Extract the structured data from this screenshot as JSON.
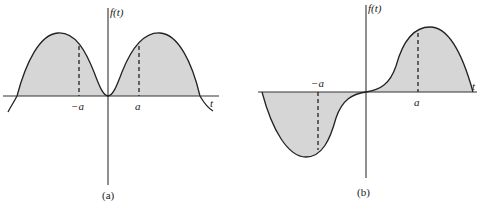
{
  "figure": {
    "panels": [
      {
        "id": "a",
        "caption": "(a)",
        "y_axis_label": "f(t)",
        "x_axis_label": "t",
        "tick_labels": [
          "−a",
          "a"
        ],
        "description": "Even function: two symmetric humps, shaded area above t-axis, touching zero at origin"
      },
      {
        "id": "b",
        "caption": "(b)",
        "y_axis_label": "f(t)",
        "x_axis_label": "t",
        "tick_labels": [
          "−a",
          "a"
        ],
        "description": "Odd function: negative lobe for t<0, positive lobe for t>0, passing through origin; shaded area between curve and t-axis"
      }
    ],
    "colors": {
      "shade": "#d6d6d6",
      "line": "#222222",
      "background": "#ffffff"
    }
  }
}
